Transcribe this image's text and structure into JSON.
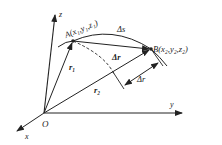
{
  "diagram": {
    "type": "displacement-vector-3d",
    "axes": {
      "x_label": "x",
      "y_label": "y",
      "z_label": "z",
      "origin_label": "O"
    },
    "points": {
      "A": {
        "name": "A",
        "coords": "(x",
        "x_sub": "1",
        "y_sub": "1",
        "z_sub": "1"
      },
      "B": {
        "name": "B",
        "coords": "(x",
        "x_sub": "2",
        "y_sub": "2",
        "z_sub": "2"
      }
    },
    "labels": {
      "path_length": "Δs",
      "chord_displacement": "Δr",
      "magnitude_difference": "Δr",
      "r1": "r",
      "r1_sub": "1",
      "r2": "r",
      "r2_sub": "2"
    },
    "texts": {
      "A_label": "A(x₁,y₁,z₁)",
      "B_label": "B(x₂,y₂,z₂)",
      "delta_s": "Δs",
      "delta_r_vec": "Δr",
      "delta_r_mag": "Δr",
      "r1": "r₁",
      "r2": "r₂",
      "x": "x",
      "y": "y",
      "z": "z",
      "O": "O"
    },
    "colors": {
      "stroke": "#222222",
      "background": "#ffffff"
    }
  }
}
